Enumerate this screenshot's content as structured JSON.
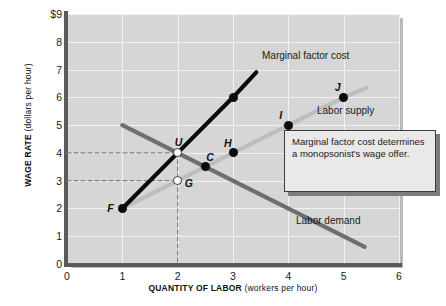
{
  "chart_data": {
    "type": "line",
    "title": "",
    "xlabel_bold": "QUANTITY OF LABOR",
    "xlabel_unit": "(workers per hour)",
    "ylabel_bold": "WAGE RATE",
    "ylabel_unit": "(dollars per hour)",
    "xlim": [
      0,
      6
    ],
    "ylim": [
      0,
      9
    ],
    "xticks": [
      "0",
      "1",
      "2",
      "3",
      "4",
      "5",
      "6"
    ],
    "yticks": [
      "$9",
      "8",
      "7",
      "6",
      "5",
      "4",
      "3",
      "2",
      "1",
      "0"
    ],
    "grid": true,
    "legend_position": "inline-annotations",
    "series": [
      {
        "name": "Marginal factor cost",
        "color": "#0b0b0b",
        "points": [
          [
            1,
            2
          ],
          [
            2,
            4
          ],
          [
            3,
            6
          ],
          [
            3.42,
            6.9
          ]
        ]
      },
      {
        "name": "Labor supply",
        "color": "#bdbdbd",
        "points": [
          [
            1,
            2
          ],
          [
            2,
            3
          ],
          [
            4,
            5
          ],
          [
            5,
            6
          ],
          [
            5.42,
            6.35
          ]
        ]
      },
      {
        "name": "Labor demand",
        "color": "#6e6e6e",
        "points": [
          [
            1,
            5
          ],
          [
            2.5,
            3.5
          ],
          [
            5.38,
            0.62
          ]
        ]
      }
    ],
    "points": [
      {
        "label": "F",
        "x": 1,
        "y": 2,
        "style": "filled",
        "label_side": "left"
      },
      {
        "label": "U",
        "x": 2,
        "y": 4,
        "style": "open",
        "label_side": "above"
      },
      {
        "label": "G",
        "x": 2,
        "y": 3,
        "style": "open",
        "label_side": "right"
      },
      {
        "label": "C",
        "x": 2.5,
        "y": 3.5,
        "style": "filled",
        "label_side": "above-right"
      },
      {
        "label": "H",
        "x": 3,
        "y": 4,
        "style": "filled",
        "label_side": "above-left"
      },
      {
        "label": "I",
        "x": 4,
        "y": 5,
        "style": "filled",
        "label_side": "above-left"
      },
      {
        "label": "J",
        "x": 5,
        "y": 6,
        "style": "filled",
        "label_side": "above-left"
      },
      {
        "label": "",
        "x": 3,
        "y": 6,
        "style": "filled",
        "label_side": "none"
      }
    ],
    "dashed_guides": [
      {
        "from": [
          0,
          4
        ],
        "to": [
          2,
          4
        ]
      },
      {
        "from": [
          0,
          3
        ],
        "to": [
          2,
          3
        ]
      },
      {
        "from": [
          2,
          4
        ],
        "to": [
          2,
          0
        ]
      }
    ],
    "curve_labels": [
      {
        "text": "Marginal factor cost",
        "x": 262,
        "y": 50
      },
      {
        "text": "Labor supply",
        "x": 317,
        "y": 105
      },
      {
        "text": "Labor demand",
        "x": 296,
        "y": 215
      }
    ]
  },
  "callout": {
    "text": "Marginal factor cost determines a monopsonist's wage offer."
  }
}
